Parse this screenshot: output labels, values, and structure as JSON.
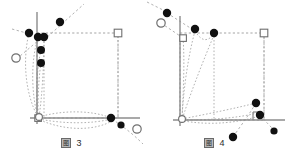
{
  "figure": {
    "panels": [
      {
        "id": "panel-left",
        "caption": {
          "glyph": "图",
          "number": "3"
        },
        "axes": {
          "origin": [
            37,
            118
          ],
          "y_axis": {
            "x": 37,
            "y_top": 12,
            "y_bottom": 124,
            "color": "#8c8c8c"
          },
          "x_axis": {
            "y": 118,
            "x_left": 30,
            "x_right": 140,
            "color": "#8c8c8c"
          }
        },
        "rect": {
          "x": 37,
          "y": 32,
          "w": 82,
          "h": 86,
          "style": "dashed",
          "color": "#9a9a9a"
        },
        "markers": {
          "filled_circles": [
            {
              "x": 60,
              "y": 22,
              "r": 4.2
            },
            {
              "x": 29,
              "y": 33,
              "r": 4.2
            },
            {
              "x": 38,
              "y": 38,
              "r": 4.2
            },
            {
              "x": 44,
              "y": 38,
              "r": 4.2
            },
            {
              "x": 41,
              "y": 50,
              "r": 4.0
            },
            {
              "x": 41,
              "y": 63,
              "r": 4.0
            },
            {
              "x": 111,
              "y": 118,
              "r": 4.2
            },
            {
              "x": 121,
              "y": 125,
              "r": 3.6
            }
          ],
          "open_circles": [
            {
              "x": 16,
              "y": 58,
              "r": 4.2
            },
            {
              "x": 137,
              "y": 129,
              "r": 4.2
            },
            {
              "x": 39,
              "y": 117,
              "r": 3.6
            }
          ],
          "open_squares": [
            {
              "x": 118,
              "y": 33,
              "s": 7.5
            },
            {
              "x": 38,
              "y": 118,
              "s": 6.5
            }
          ]
        },
        "color": {
          "marker_fill": "#111111",
          "marker_open_stroke": "#6f6f6f",
          "dotted": "#a8a8a8"
        }
      },
      {
        "id": "panel-right",
        "caption": {
          "glyph": "图",
          "number": "4"
        },
        "axes": {
          "origin": [
            37,
            120
          ],
          "y_axis": {
            "x": 37,
            "y_top": 16,
            "y_bottom": 126,
            "color": "#8c8c8c"
          },
          "x_axis": {
            "y": 120,
            "x_left": 30,
            "x_right": 142,
            "color": "#8c8c8c"
          }
        },
        "rect": {
          "x": 37,
          "y": 33,
          "w": 84,
          "h": 87,
          "style": "dashed",
          "color": "#9a9a9a"
        },
        "markers": {
          "filled_circles": [
            {
              "x": 24,
              "y": 13,
              "r": 4.2
            },
            {
              "x": 52,
              "y": 29,
              "r": 4.2
            },
            {
              "x": 71,
              "y": 33,
              "r": 4.2
            },
            {
              "x": 113,
              "y": 103,
              "r": 4.2
            },
            {
              "x": 117,
              "y": 115,
              "r": 4.2
            },
            {
              "x": 90,
              "y": 137,
              "r": 4.2
            },
            {
              "x": 131,
              "y": 131,
              "r": 3.6
            }
          ],
          "open_circles": [
            {
              "x": 18,
              "y": 23,
              "r": 4.2
            },
            {
              "x": 39,
              "y": 119,
              "r": 3.6
            }
          ],
          "open_squares": [
            {
              "x": 40,
              "y": 38,
              "s": 6.5
            },
            {
              "x": 121,
              "y": 33,
              "s": 7.5
            }
          ]
        },
        "color": {
          "marker_fill": "#111111",
          "marker_open_stroke": "#6f6f6f",
          "dotted": "#a8a8a8"
        }
      }
    ]
  }
}
